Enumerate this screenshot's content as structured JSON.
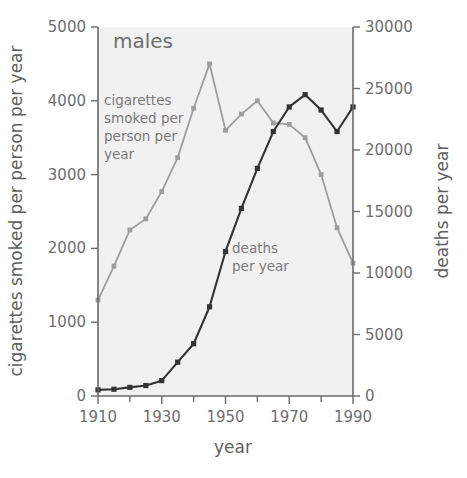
{
  "panel": {
    "title": "males"
  },
  "axes": {
    "x": {
      "title": "year",
      "ticklabels": [
        "1910",
        "1930",
        "1950",
        "1970",
        "1990"
      ],
      "tickvalues": [
        1910,
        1930,
        1950,
        1970,
        1990
      ],
      "minorticks": [
        1920,
        1940,
        1960,
        1980
      ],
      "range": [
        1910,
        1990
      ]
    },
    "yleft": {
      "title": "cigarettes smoked per person per year",
      "ticklabels": [
        "0",
        "1000",
        "2000",
        "3000",
        "4000",
        "5000"
      ],
      "tickvalues": [
        0,
        1000,
        2000,
        3000,
        4000,
        5000
      ],
      "range": [
        0,
        5000
      ]
    },
    "yright": {
      "title": "deaths per year",
      "ticklabels": [
        "0",
        "5000",
        "10000",
        "15000",
        "20000",
        "25000",
        "30000"
      ],
      "tickvalues": [
        0,
        5000,
        10000,
        15000,
        20000,
        25000,
        30000
      ],
      "range": [
        0,
        30000
      ]
    }
  },
  "annotations": {
    "cigarettes_label": "cigarettes smoked per person per year",
    "cigarettes_label_lines": [
      "cigarettes",
      "smoked per",
      "person per",
      "year"
    ],
    "deaths_label": "deaths per year",
    "deaths_label_lines": [
      "deaths",
      "per year"
    ]
  },
  "colors": {
    "cigarettes_line": "#9e9e9e",
    "deaths_line": "#333333",
    "plot_background": "#f1f1f1",
    "axis": "#6b6b6b",
    "text": "#6e6e6e"
  },
  "chart_data": {
    "type": "line",
    "title": "males",
    "xlabel": "year",
    "ylabel": "cigarettes smoked per person per year",
    "y2label": "deaths per year",
    "xlim": [
      1910,
      1990
    ],
    "ylim": [
      0,
      5000
    ],
    "y2lim": [
      0,
      30000
    ],
    "grid": false,
    "legend": "inline-annotations",
    "series": [
      {
        "name": "cigarettes smoked per person per year",
        "axis": "left",
        "color": "#9e9e9e",
        "units": "cigarettes per person per year",
        "x": [
          1910,
          1915,
          1920,
          1925,
          1930,
          1935,
          1940,
          1945,
          1950,
          1955,
          1960,
          1965,
          1970,
          1975,
          1980,
          1985,
          1990
        ],
        "values": [
          1300,
          1760,
          2250,
          2400,
          2770,
          3230,
          3900,
          4500,
          3600,
          3820,
          4000,
          3700,
          3680,
          3500,
          3000,
          2280,
          1800
        ]
      },
      {
        "name": "deaths per year",
        "axis": "right",
        "color": "#333333",
        "units": "deaths per year",
        "x": [
          1910,
          1915,
          1920,
          1925,
          1930,
          1935,
          1940,
          1945,
          1950,
          1955,
          1960,
          1965,
          1970,
          1975,
          1980,
          1985,
          1990
        ],
        "values": [
          500,
          550,
          700,
          850,
          1250,
          2750,
          4250,
          7250,
          11750,
          15250,
          18500,
          21500,
          23500,
          24500,
          23250,
          21500,
          23500
        ]
      }
    ]
  }
}
